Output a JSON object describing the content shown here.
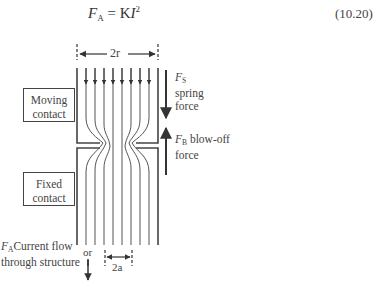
{
  "equation": {
    "lhs_symbol": "F",
    "lhs_subscript": "A",
    "equals": " = ",
    "constant": "K",
    "variable": "I",
    "exponent": "2",
    "number": "(10.20)"
  },
  "diagram": {
    "top_dimension_label": "2r",
    "bottom_dimension_label": "2a",
    "moving_contact": {
      "line1": "Moving",
      "line2": "contact"
    },
    "fixed_contact": {
      "line1": "Fixed",
      "line2": "contact"
    },
    "spring_force": {
      "symbol": "F",
      "subscript": "S",
      "line1": "spring",
      "line2": "force"
    },
    "blowoff_force": {
      "symbol": "F",
      "subscript": "B",
      "text": " blow-off",
      "line2": "force"
    },
    "current_flow": {
      "symbol": "F",
      "subscript": "A",
      "text": "Current flow",
      "line2": "through structure",
      "or": "or"
    },
    "colors": {
      "line": "#444444",
      "background": "#ffffff"
    }
  }
}
